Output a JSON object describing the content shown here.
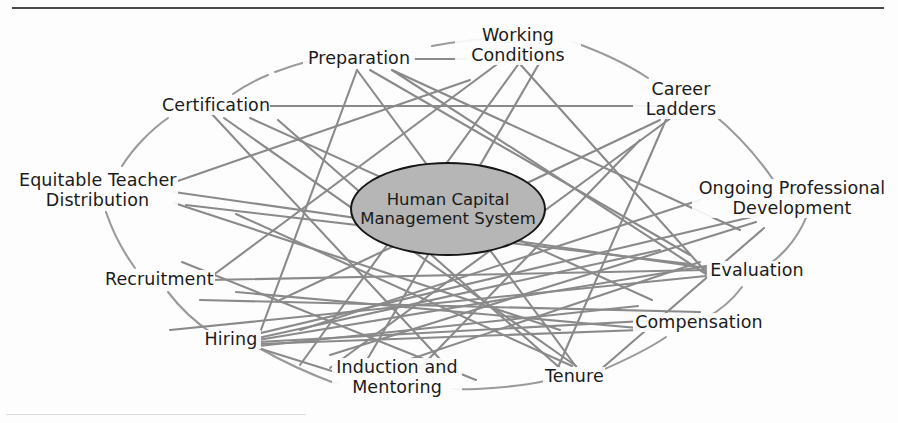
{
  "figure": {
    "center": {
      "label": "Human Capital\nManagement System",
      "fill_color": "#b6b6b6",
      "border_color": "#161616"
    },
    "line_color": "#8a8a8a",
    "arc_color": "#9a9a9a",
    "rule_color": "#4a4a4a",
    "nodes": [
      {
        "id": "preparation",
        "label": "Preparation",
        "x": 357,
        "y": 59,
        "anchor": "middle"
      },
      {
        "id": "working-conditions",
        "label": "Working\nConditions",
        "x": 516,
        "y": 47,
        "anchor": "middle"
      },
      {
        "id": "career-ladders",
        "label": "Career\nLadders",
        "x": 679,
        "y": 100,
        "anchor": "middle"
      },
      {
        "id": "ongoing-professional-development",
        "label": "Ongoing Professional\nDevelopment",
        "x": 789,
        "y": 199,
        "anchor": "middle"
      },
      {
        "id": "evaluation",
        "label": "Evaluation",
        "x": 755,
        "y": 271,
        "anchor": "middle"
      },
      {
        "id": "compensation",
        "label": "Compensation",
        "x": 697,
        "y": 323,
        "anchor": "middle"
      },
      {
        "id": "tenure",
        "label": "Tenure",
        "x": 572,
        "y": 377,
        "anchor": "middle"
      },
      {
        "id": "induction-and-mentoring",
        "label": "Induction and\nMentoring",
        "x": 395,
        "y": 378,
        "anchor": "middle"
      },
      {
        "id": "hiring",
        "label": "Hiring",
        "x": 229,
        "y": 340,
        "anchor": "middle"
      },
      {
        "id": "recruitment",
        "label": "Recruitment",
        "x": 157,
        "y": 280,
        "anchor": "middle"
      },
      {
        "id": "equitable-teacher-distribution",
        "label": "Equitable Teacher\nDistribution",
        "x": 95,
        "y": 191,
        "anchor": "middle"
      },
      {
        "id": "certification",
        "label": "Certification",
        "x": 213,
        "y": 106,
        "anchor": "middle"
      }
    ]
  }
}
